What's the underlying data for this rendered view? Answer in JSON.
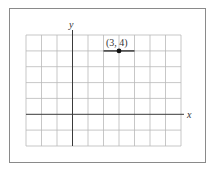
{
  "figure": {
    "axis_labels": {
      "x": "x",
      "y": "y"
    },
    "point_label": "(3, 4)",
    "point": {
      "x": 3,
      "y": 4
    },
    "grid": {
      "x_min": -3,
      "x_max": 7,
      "y_min": -2,
      "y_max": 5,
      "columns": 10,
      "rows": 7
    },
    "segment": {
      "x_from": 2,
      "x_to": 4,
      "y": 4
    },
    "colors": {
      "grid": "#b9b9b9",
      "axis": "#3a3a3a",
      "frame": "#8a8a8a",
      "point": "#111111"
    }
  }
}
